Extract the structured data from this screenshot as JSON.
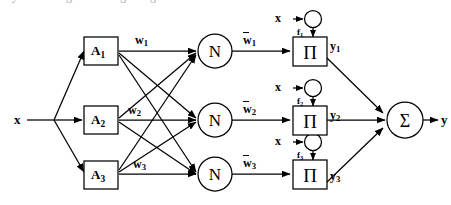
{
  "diagram": {
    "background_color": "#ffffff",
    "stroke_color": "#000000",
    "input": {
      "label": "x",
      "name": "primary-input"
    },
    "output": {
      "label": "y",
      "name": "final-output"
    },
    "layer_a": {
      "nodes": [
        {
          "label": "A",
          "subscript": "1"
        },
        {
          "label": "A",
          "subscript": "2"
        },
        {
          "label": "A",
          "subscript": "3"
        }
      ]
    },
    "weights_in": [
      {
        "label": "w",
        "subscript": "1"
      },
      {
        "label": "w",
        "subscript": "2"
      },
      {
        "label": "w",
        "subscript": "3"
      }
    ],
    "layer_n": {
      "nodes": [
        {
          "label": "N"
        },
        {
          "label": "N"
        },
        {
          "label": "N"
        }
      ]
    },
    "weights_out": [
      {
        "label": "w",
        "subscript": "1",
        "overbar": true
      },
      {
        "label": "w",
        "subscript": "2",
        "overbar": true
      },
      {
        "label": "w",
        "subscript": "3",
        "overbar": true
      }
    ],
    "feedback_inputs": [
      {
        "input_label": "x",
        "func_label": "f",
        "func_subscript": "1"
      },
      {
        "input_label": "x",
        "func_label": "f",
        "func_subscript": "2"
      },
      {
        "input_label": "x",
        "func_label": "f",
        "func_subscript": "3"
      }
    ],
    "layer_product": {
      "nodes": [
        {
          "label": "Π"
        },
        {
          "label": "Π"
        },
        {
          "label": "Π"
        }
      ]
    },
    "intermediate_outputs": [
      {
        "label": "y",
        "subscript": "1"
      },
      {
        "label": "y",
        "subscript": "2"
      },
      {
        "label": "y",
        "subscript": "3"
      }
    ],
    "summation": {
      "label": "Σ",
      "name": "summation-node"
    }
  }
}
